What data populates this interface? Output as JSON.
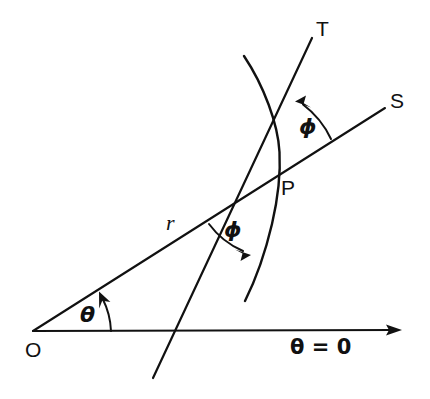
{
  "figure": {
    "kind": "geometry-diagram",
    "background_color": "#ffffff",
    "ink_color": "#111111",
    "width": 430,
    "height": 399
  },
  "labels": {
    "origin": "O",
    "point_p": "P",
    "tangent_line": "T",
    "radial_ray": "S",
    "radius": "r",
    "theta": "θ",
    "phi_upper": "ϕ",
    "phi_lower": "ϕ",
    "polar_axis": "θ = 0"
  },
  "geometry": {
    "origin": {
      "x": 33,
      "y": 331
    },
    "point_p": {
      "x": 275,
      "y": 178
    },
    "polar_axis": {
      "x1": 33,
      "y1": 331,
      "x2": 400,
      "y2": 330
    },
    "radial_ray_S": {
      "x1": 33,
      "y1": 331,
      "x2": 385,
      "y2": 108
    },
    "tangent_line_T": {
      "x1": 153,
      "y1": 378,
      "x2": 312,
      "y2": 38
    },
    "curve_endpoints": {
      "start_x": 244,
      "start_y": 56,
      "end_x": 245,
      "end_y": 301
    },
    "theta_arc": {
      "from_deg": 0,
      "to_deg": 32,
      "radius": 78
    },
    "phi_upper_arc": {
      "vertex": "P",
      "radius": 92
    },
    "phi_lower_arc": {
      "vertex": "P",
      "radius": 83
    }
  },
  "label_positions": {
    "origin": {
      "x": 25,
      "y": 357
    },
    "point_p": {
      "x": 281,
      "y": 195
    },
    "tangent_line": {
      "x": 316,
      "y": 36
    },
    "radial_ray": {
      "x": 390,
      "y": 108
    },
    "radius": {
      "x": 166,
      "y": 230
    },
    "theta": {
      "x": 80,
      "y": 322
    },
    "phi_upper": {
      "x": 299,
      "y": 134
    },
    "phi_lower": {
      "x": 224,
      "y": 237
    },
    "polar_axis": {
      "x": 290,
      "y": 354
    }
  },
  "annotations": {
    "description": "A ray S drawn from origin O through point P on a curve; T is the tangent to the curve at P. The angle between the radius vector OP and the tangent is marked phi in two places (above and below P). The angle theta is measured from the polar axis (theta = 0) to the radius vector r."
  }
}
